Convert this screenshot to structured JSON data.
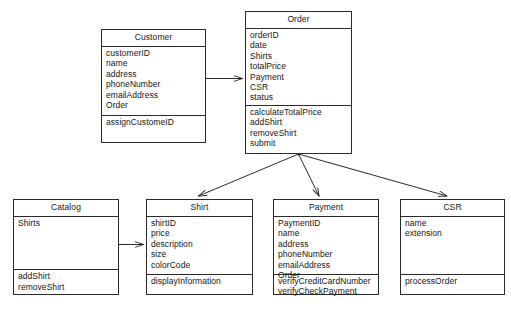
{
  "diagram": {
    "type": "uml-class-diagram",
    "line_color": "#2b2b2b",
    "background": "#ffffff",
    "caption": ""
  },
  "classes": [
    {
      "id": "customer",
      "name": "Customer",
      "attributes": [
        "customerID",
        "name",
        "address",
        "phoneNumber",
        "emailAddress",
        "Order"
      ],
      "methods": [
        "assignCustomeID"
      ]
    },
    {
      "id": "order",
      "name": "Order",
      "attributes": [
        "orderID",
        "date",
        "Shirts",
        "totalPrice",
        "Payment",
        "CSR",
        "status"
      ],
      "methods": [
        "calculateTotalPrice",
        "addShirt",
        "removeShirt",
        "submit"
      ]
    },
    {
      "id": "catalog",
      "name": "Catalog",
      "attributes": [
        "Shirts"
      ],
      "methods": [
        "addShirt",
        "removeShirt"
      ]
    },
    {
      "id": "shirt",
      "name": "Shirt",
      "attributes": [
        "shirtID",
        "price",
        "description",
        "size",
        "colorCode"
      ],
      "methods": [
        "displayInformation"
      ]
    },
    {
      "id": "payment",
      "name": "Payment",
      "attributes": [
        "PaymentID",
        "name",
        "address",
        "phoneNumber",
        "emailAddress",
        "Order"
      ],
      "methods": [
        "verifyCreditCardNumber",
        "verifyCheckPayment"
      ]
    },
    {
      "id": "csr",
      "name": "CSR",
      "attributes": [
        "name",
        "extension"
      ],
      "methods": [
        "processOrder"
      ]
    }
  ],
  "associations": [
    {
      "from": "customer",
      "to": "order",
      "kind": "directed"
    },
    {
      "from": "order",
      "to": "shirt",
      "kind": "directed"
    },
    {
      "from": "order",
      "to": "payment",
      "kind": "directed"
    },
    {
      "from": "order",
      "to": "csr",
      "kind": "directed"
    },
    {
      "from": "catalog",
      "to": "shirt",
      "kind": "directed"
    }
  ]
}
